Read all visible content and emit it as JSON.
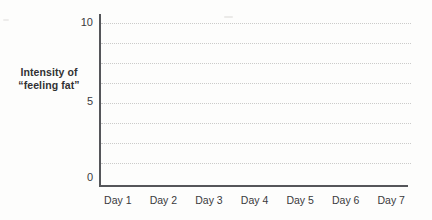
{
  "chart_data": {
    "type": "line",
    "title": "",
    "ylabel_line1": "Intensity of",
    "ylabel_line2": "“feeling fat”",
    "y_tick_labels": [
      "10",
      "5",
      "0"
    ],
    "ylim": [
      0,
      10
    ],
    "categories": [
      "Day 1",
      "Day 2",
      "Day 3",
      "Day 4",
      "Day 5",
      "Day 6",
      "Day 7"
    ],
    "series": [],
    "gridlines": {
      "style": "dotted",
      "values": [
        10,
        8.75,
        7.5,
        6.25,
        5,
        3.75,
        2.5,
        1.25
      ]
    },
    "legend": "none"
  },
  "colors": {
    "axis": "#55565a",
    "grid": "#cbcbca",
    "text": "#3a3a3c",
    "title_text": "#313133",
    "background": "#fdfdfc"
  }
}
